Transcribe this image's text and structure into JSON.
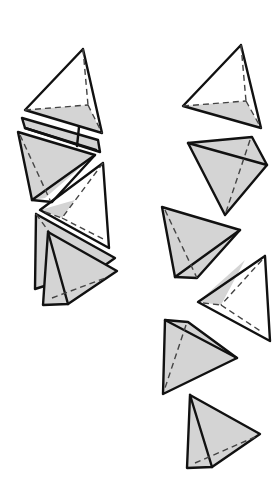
{
  "figure": {
    "title": "",
    "colors": {
      "background": "#ffffff",
      "shaded_face": "#d4d4d4",
      "edge": "#111111",
      "hidden_edge": "#444444"
    },
    "left_column_label": "",
    "right_column_label": "",
    "left_column_count": 6,
    "right_column_count": 6
  }
}
